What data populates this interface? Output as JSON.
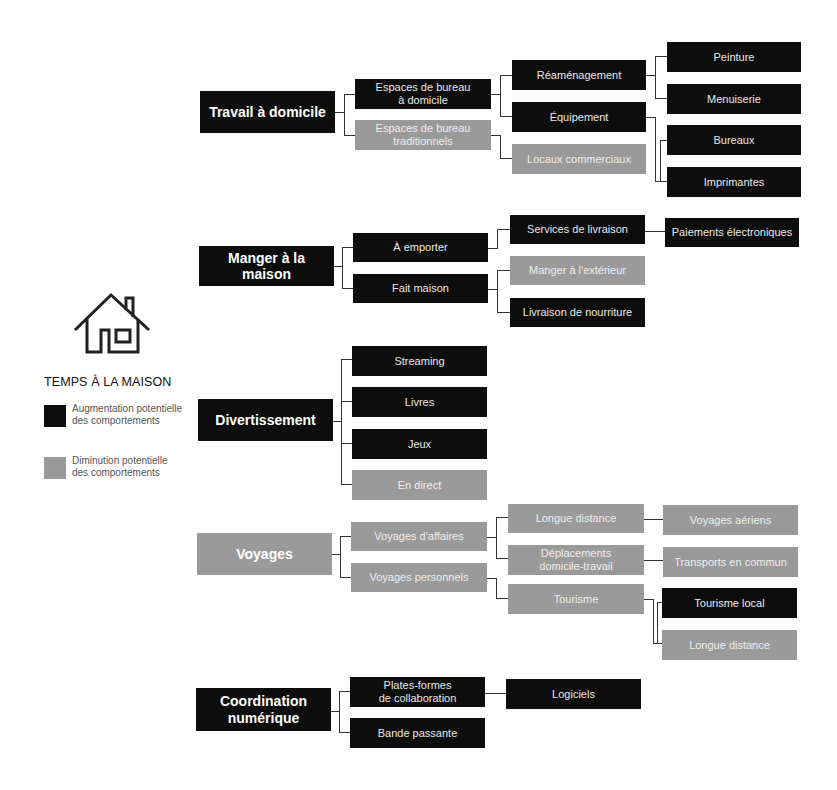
{
  "title": "TEMPS À LA MAISON",
  "legend": {
    "increase": {
      "label_line1": "Augmentation potentielle",
      "label_line2": "des comportements",
      "color": "#0d0d0d"
    },
    "decrease": {
      "label_line1": "Diminution potentielle",
      "label_line2": "des comportements",
      "color": "#9a9a9a"
    }
  },
  "icon": "house-icon",
  "tree": {
    "travail": {
      "label": "Travail à domicile",
      "type": "increase",
      "children": {
        "espaces_domicile": {
          "label_line1": "Espaces de bureau",
          "label_line2": "à domicile",
          "type": "increase"
        },
        "espaces_trad": {
          "label_line1": "Espaces de bureau",
          "label_line2": "traditionnels",
          "type": "decrease"
        },
        "reamenagement": {
          "label": "Réaménagement",
          "type": "increase"
        },
        "equipement": {
          "label": "Équipement",
          "type": "increase"
        },
        "locaux": {
          "label": "Locaux commerciaux",
          "type": "decrease"
        },
        "peinture": {
          "label": "Peinture",
          "type": "increase"
        },
        "menuiserie": {
          "label": "Menuiserie",
          "type": "increase"
        },
        "bureaux": {
          "label": "Bureaux",
          "type": "increase"
        },
        "imprimantes": {
          "label": "Imprimantes",
          "type": "increase"
        }
      }
    },
    "manger": {
      "label": "Manger à la maison",
      "type": "increase",
      "children": {
        "emporter": {
          "label": "À emporter",
          "type": "increase"
        },
        "fait_maison": {
          "label": "Fait maison",
          "type": "increase"
        },
        "services_livraison": {
          "label": "Services de livraison",
          "type": "increase"
        },
        "manger_exterieur": {
          "label": "Manger à l'extérieur",
          "type": "decrease"
        },
        "livraison_nourriture": {
          "label": "Livraison de nourriture",
          "type": "increase"
        },
        "paiements": {
          "label": "Paiements électroniques",
          "type": "increase"
        }
      }
    },
    "divertissement": {
      "label": "Divertissement",
      "type": "increase",
      "children": {
        "streaming": {
          "label": "Streaming",
          "type": "increase"
        },
        "livres": {
          "label": "Livres",
          "type": "increase"
        },
        "jeux": {
          "label": "Jeux",
          "type": "increase"
        },
        "en_direct": {
          "label": "En direct",
          "type": "decrease"
        }
      }
    },
    "voyages": {
      "label": "Voyages",
      "type": "decrease",
      "children": {
        "affaires": {
          "label": "Voyages d'affaires",
          "type": "decrease"
        },
        "personnels": {
          "label": "Voyages personnels",
          "type": "decrease"
        },
        "longue_distance": {
          "label": "Longue distance",
          "type": "decrease"
        },
        "deplacements": {
          "label_line1": "Déplacements",
          "label_line2": "domicile-travail",
          "type": "decrease"
        },
        "tourisme": {
          "label": "Tourisme",
          "type": "decrease"
        },
        "aeriens": {
          "label": "Voyages aériens",
          "type": "decrease"
        },
        "transports": {
          "label": "Transports en commun",
          "type": "decrease"
        },
        "tourisme_local": {
          "label": "Tourisme local",
          "type": "increase"
        },
        "longue_distance_2": {
          "label": "Longue distance",
          "type": "decrease"
        }
      }
    },
    "coordination": {
      "label_line1": "Coordination",
      "label_line2": "numérique",
      "type": "increase",
      "children": {
        "plates_formes": {
          "label_line1": "Plates-formes",
          "label_line2": "de collaboration",
          "type": "increase"
        },
        "bande": {
          "label": "Bande passante",
          "type": "increase"
        },
        "logiciels": {
          "label": "Logiciels",
          "type": "increase"
        }
      }
    }
  }
}
